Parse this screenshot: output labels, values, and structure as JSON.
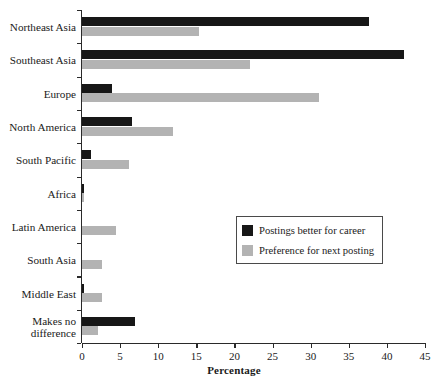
{
  "chart_data": {
    "type": "bar",
    "orientation": "horizontal",
    "title": "",
    "xlabel": "Percentage",
    "ylabel": "",
    "xlim": [
      0,
      45
    ],
    "xticks": [
      0,
      5,
      10,
      15,
      20,
      25,
      30,
      35,
      40,
      45
    ],
    "xtick_labels": [
      "0",
      "5",
      "10",
      "15",
      "20",
      "25",
      "30",
      "35",
      "40",
      "45"
    ],
    "grid": false,
    "legend_position": "center-right",
    "categories": [
      "Northeast Asia",
      "Southeast Asia",
      "Europe",
      "North America",
      "South Pacific",
      "Africa",
      "Latin America",
      "South Asia",
      "Middle East",
      "Makes no\ndifference"
    ],
    "series": [
      {
        "name": "Postings better for career",
        "color": "#171717",
        "values": [
          37.6,
          42.2,
          4.0,
          6.6,
          1.2,
          0.3,
          0.0,
          0.0,
          0.3,
          7.0
        ]
      },
      {
        "name": "Preference for next posting",
        "color": "#b3b3b3",
        "values": [
          15.4,
          22.0,
          31.1,
          12.0,
          6.2,
          0.3,
          4.5,
          2.6,
          2.6,
          2.1
        ]
      }
    ]
  },
  "legend": {
    "items": [
      {
        "label": "Postings better for career",
        "swatch": "#171717"
      },
      {
        "label": "Preference for next posting",
        "swatch": "#b3b3b3"
      }
    ]
  },
  "axis": {
    "x_title": "Percentage"
  }
}
